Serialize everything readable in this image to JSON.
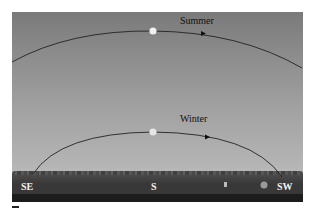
{
  "figure": {
    "paths": [
      {
        "label": "Summer",
        "sun_position": "top-of-arc"
      },
      {
        "label": "Winter",
        "sun_position": "top-of-arc"
      }
    ],
    "directions": {
      "left": "SE",
      "center": "S",
      "right": "SW"
    },
    "colors": {
      "sky_top": "#7a7a7a",
      "sky_horizon": "#bdbdbd",
      "ground": "#1c1c1c",
      "arc": "#222222",
      "sun": "#f0f0f0"
    }
  }
}
